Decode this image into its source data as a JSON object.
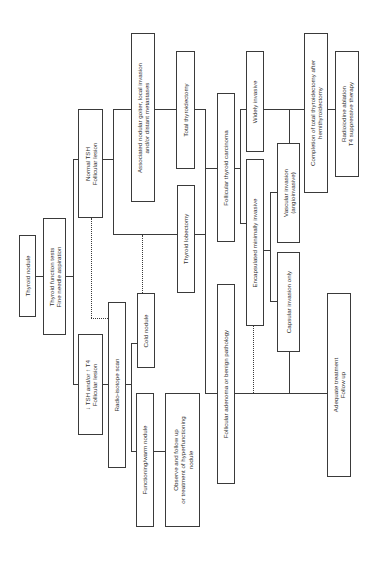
{
  "diagram": {
    "type": "flowchart",
    "orientation": "rotated-90-ccw",
    "nodes": {
      "thyroid_nodule": {
        "lines": [
          "Thyroid nodule"
        ]
      },
      "tft_fna": {
        "lines": [
          "Thyroid function tests",
          "Fine needle aspiration"
        ]
      },
      "normal_tsh": {
        "lines": [
          "Normal TSH",
          "Follicular lesion"
        ]
      },
      "low_tsh": {
        "lines": [
          "↓ TSH and/or ↑ T4",
          "Follicular lesion"
        ]
      },
      "associated_goiter": {
        "lines": [
          "Associated nodular goiter, local invasion",
          "and/or distant metastases"
        ]
      },
      "total_thyroidectomy": {
        "lines": [
          "Total thyroidectomy"
        ]
      },
      "thyroid_lobectomy": {
        "lines": [
          "Thyroid lobectomy"
        ]
      },
      "radioisotope_scan": {
        "lines": [
          "Radio-isotope scan"
        ]
      },
      "cold_nodule": {
        "lines": [
          "Cold nodule"
        ]
      },
      "functioning_nodule": {
        "lines": [
          "Functioning/warm nodule"
        ]
      },
      "observe": {
        "lines": [
          "Observe and follow up",
          "or treatment of hyperfunctioning",
          "nodule"
        ]
      },
      "follicular_carcinoma": {
        "lines": [
          "Follicular thyroid carcinoma"
        ]
      },
      "follicular_adenoma": {
        "lines": [
          "Follicular adenoma or benign pathology"
        ]
      },
      "widely_invasive": {
        "lines": [
          "Widely invasive"
        ]
      },
      "encapsulated": {
        "lines": [
          "Encapsulated minimally invasive"
        ]
      },
      "vascular_invasion": {
        "lines": [
          "Vascular invasion",
          "(angioinvasive)"
        ]
      },
      "capsular_invasion": {
        "lines": [
          "Capsular invasion only"
        ]
      },
      "completion": {
        "lines": [
          "Completion of total thyroidectomy after",
          "hemithyroidectomy"
        ]
      },
      "radioiodine": {
        "lines": [
          "Radioiodine ablation",
          "T4 suppressive therapy"
        ]
      },
      "adequate": {
        "lines": [
          "Adequate treatment",
          "Follow up"
        ]
      }
    },
    "edges": [
      {
        "from": "thyroid_nodule",
        "to": "tft_fna",
        "style": "solid"
      },
      {
        "from": "tft_fna",
        "to": "normal_tsh",
        "style": "solid"
      },
      {
        "from": "tft_fna",
        "to": "low_tsh",
        "style": "solid"
      },
      {
        "from": "normal_tsh",
        "to": "associated_goiter",
        "style": "solid"
      },
      {
        "from": "normal_tsh",
        "to": "thyroid_lobectomy",
        "style": "solid"
      },
      {
        "from": "normal_tsh",
        "to": "radioisotope_scan",
        "style": "dotted"
      },
      {
        "from": "associated_goiter",
        "to": "total_thyroidectomy",
        "style": "solid"
      },
      {
        "from": "low_tsh",
        "to": "radioisotope_scan",
        "style": "solid"
      },
      {
        "from": "radioisotope_scan",
        "to": "cold_nodule",
        "style": "solid"
      },
      {
        "from": "radioisotope_scan",
        "to": "functioning_nodule",
        "style": "solid"
      },
      {
        "from": "functioning_nodule",
        "to": "observe",
        "style": "solid"
      },
      {
        "from": "cold_nodule",
        "to": "thyroid_lobectomy",
        "style": "dotted"
      },
      {
        "from": "total_thyroidectomy",
        "to": "follicular_carcinoma",
        "style": "solid"
      },
      {
        "from": "thyroid_lobectomy",
        "to": "follicular_carcinoma",
        "style": "solid"
      },
      {
        "from": "thyroid_lobectomy",
        "to": "follicular_adenoma",
        "style": "solid"
      },
      {
        "from": "follicular_carcinoma",
        "to": "widely_invasive",
        "style": "solid"
      },
      {
        "from": "follicular_carcinoma",
        "to": "encapsulated",
        "style": "solid"
      },
      {
        "from": "encapsulated",
        "to": "vascular_invasion",
        "style": "solid"
      },
      {
        "from": "encapsulated",
        "to": "capsular_invasion",
        "style": "solid"
      },
      {
        "from": "widely_invasive",
        "to": "completion",
        "style": "solid"
      },
      {
        "from": "vascular_invasion",
        "to": "completion",
        "style": "solid"
      },
      {
        "from": "completion",
        "to": "radioiodine",
        "style": "solid"
      },
      {
        "from": "follicular_adenoma",
        "to": "adequate",
        "style": "solid"
      },
      {
        "from": "capsular_invasion",
        "to": "adequate",
        "style": "solid"
      },
      {
        "from": "encapsulated",
        "to": "adequate",
        "style": "dotted"
      }
    ]
  }
}
